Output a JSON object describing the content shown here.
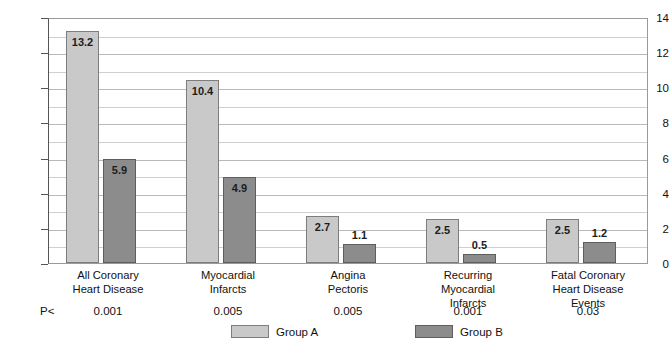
{
  "chart_data": {
    "type": "bar",
    "title": "",
    "xlabel": "",
    "ylabel": "Annual Rate / 1,000 at Risk",
    "ylim": [
      0,
      14
    ],
    "ytick_step": 2,
    "gridline_step": 1,
    "grid": true,
    "legend_position": "bottom",
    "categories": [
      "All Coronary Heart Disease",
      "Myocardial Infarcts",
      "Angina Pectoris",
      "Recurring Myocardial Infarcts",
      "Fatal Coronary Heart Disease Events"
    ],
    "category_label_lines": [
      [
        "All Coronary",
        "Heart Disease"
      ],
      [
        "Myocardial",
        "Infarcts"
      ],
      [
        "Angina",
        "Pectoris"
      ],
      [
        "Recurring",
        "Myocardial",
        "Infarcts"
      ],
      [
        "Fatal Coronary",
        "Heart Disease",
        "Events"
      ]
    ],
    "series": [
      {
        "name": "Group A",
        "color": "#c9c9c9",
        "values": [
          13.2,
          10.4,
          2.7,
          2.5,
          2.5
        ],
        "value_labels": [
          "13.2",
          "10.4",
          "2.7",
          "2.5",
          "2.5"
        ]
      },
      {
        "name": "Group B",
        "color": "#8c8c8c",
        "values": [
          5.9,
          4.9,
          1.1,
          0.5,
          1.2
        ],
        "value_labels": [
          "5.9",
          "4.9",
          "1.1",
          "0.5",
          "1.2"
        ]
      }
    ],
    "ytick_labels": [
      "14",
      "12",
      "10",
      "8",
      "6",
      "4",
      "2",
      "0"
    ],
    "ytick_values": [
      14,
      12,
      10,
      8,
      6,
      4,
      2,
      0
    ],
    "annotations": {
      "p_prefix": "P<",
      "p_values": [
        "0.001",
        "0.005",
        "0.005",
        "0.001",
        "0.03"
      ]
    }
  },
  "legend": {
    "items": [
      {
        "label": "Group A",
        "swatch": "group-a"
      },
      {
        "label": "Group B",
        "swatch": "group-b"
      }
    ]
  }
}
